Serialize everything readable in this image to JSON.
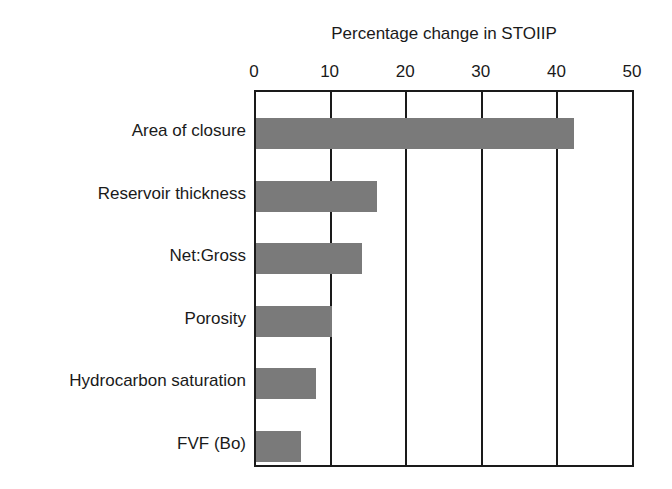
{
  "chart_data": {
    "type": "bar",
    "orientation": "horizontal",
    "title": "Percentage change in STOIIP",
    "xlabel": "Percentage change in STOIIP",
    "ylabel": "",
    "xlim": [
      0,
      50
    ],
    "x_ticks": [
      "0",
      "10",
      "20",
      "30",
      "40",
      "50"
    ],
    "x_axis_position": "top",
    "grid": "vertical",
    "legend": null,
    "bar_color": "#7a7a7a",
    "categories": [
      "Area of closure",
      "Reservoir thickness",
      "Net:Gross",
      "Porosity",
      "Hydrocarbon saturation",
      "FVF (Bo)"
    ],
    "values": [
      42,
      16,
      14,
      10,
      8,
      6
    ]
  }
}
